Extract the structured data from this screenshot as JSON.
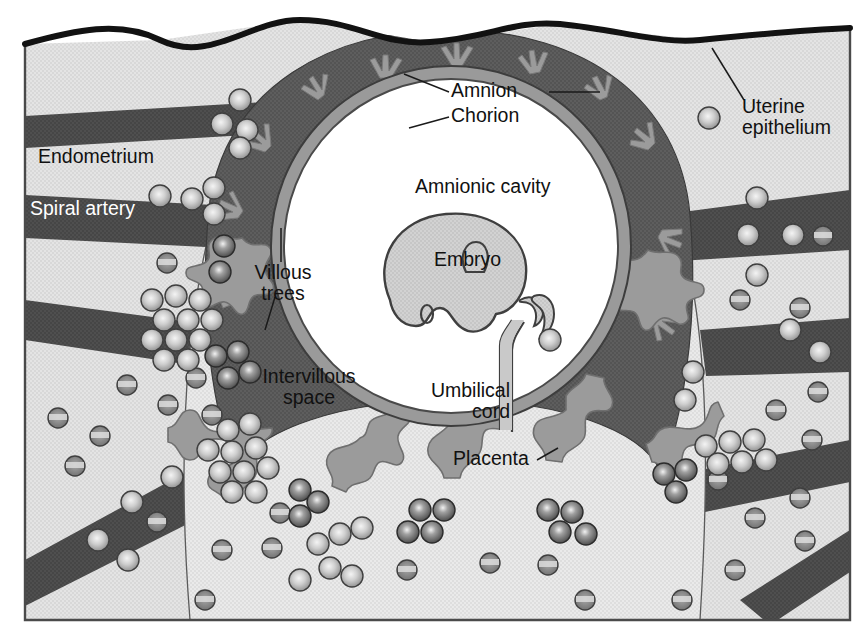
{
  "figure": {
    "type": "anatomical-cross-section",
    "width": 867,
    "height": 642
  },
  "labels": {
    "uterine_epithelium": "Uterine\nepithelium",
    "endometrium": "Endometrium",
    "spiral_artery": "Spiral artery",
    "amnion": "Amnion",
    "chorion": "Chorion",
    "amnionic_cavity": "Amnionic cavity",
    "embryo": "Embryo",
    "umbilical_cord": "Umbilical\ncord",
    "placenta": "Placenta",
    "villous_trees": "Villous\ntrees",
    "intervillous_space": "Intervillous\nspace"
  },
  "colors": {
    "background": "#ffffff",
    "endometrium_fill": "#e4e4e4",
    "vessel_dark": "#4f4f4f",
    "chorion_dark": "#5e5e5e",
    "amnion_ring": "#9a9a9a",
    "villous_gray": "#9b9b9b",
    "intervillous_fill": "#e9e9e9",
    "embryo_fill": "#cfcfcf",
    "cavity_fill": "#ffffff",
    "outline": "#3a3a3a",
    "epithelium_line": "#121212",
    "label_text": "#111111",
    "label_text_on_vessel": "#ffffff"
  },
  "structures": [
    {
      "name": "uterine-epithelium",
      "description": "thick black wavy line along top of section"
    },
    {
      "name": "endometrium",
      "description": "light gray stippled tissue filling the block"
    },
    {
      "name": "spiral-artery",
      "description": "dark gray bands crossing the endometrium"
    },
    {
      "name": "chorion",
      "description": "dark gray ring around the amnionic cavity"
    },
    {
      "name": "amnion",
      "description": "lighter gray inner ring lining the cavity"
    },
    {
      "name": "amnionic-cavity",
      "description": "large white circle at center"
    },
    {
      "name": "embryo",
      "description": "gray embryo silhouette inside the cavity"
    },
    {
      "name": "umbilical-cord",
      "description": "gray cord from embryo to placenta"
    },
    {
      "name": "villous-trees",
      "description": "branched gray projections radiating into the intervillous space"
    },
    {
      "name": "intervillous-space",
      "description": "light region between villous trees filled with blood cells"
    },
    {
      "name": "trophoblast-cells",
      "description": "clustered round cells with bright centers"
    },
    {
      "name": "red-blood-cells",
      "description": "dark discs with pale central band"
    }
  ]
}
